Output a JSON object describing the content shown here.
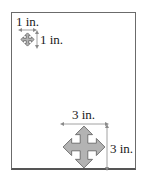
{
  "diagram": {
    "small_icon": {
      "icon": "move-arrows-icon",
      "width_label": "1 in.",
      "height_label": "1 in."
    },
    "large_icon": {
      "icon": "move-arrows-icon",
      "width_label": "3 in.",
      "height_label": "3 in."
    },
    "colors": {
      "icon_fill": "#b3b3b3",
      "icon_stroke": "#6e6e6e",
      "frame": "#6b6b6b",
      "dimension_line": "#8a8a8a"
    }
  }
}
